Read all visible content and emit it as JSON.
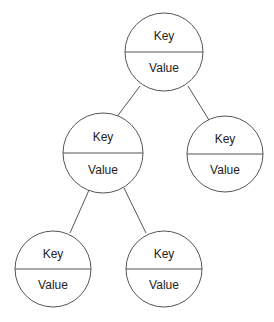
{
  "diagram": {
    "type": "binary-tree",
    "colors": {
      "stroke": "#555555",
      "text": "#222222",
      "background": "#ffffff"
    },
    "nodes": [
      {
        "id": "root",
        "key": "Key",
        "value": "Value",
        "cx": 164,
        "cy": 52,
        "r": 39
      },
      {
        "id": "left",
        "key": "Key",
        "value": "Value",
        "cx": 103,
        "cy": 153,
        "r": 40
      },
      {
        "id": "right",
        "key": "Key",
        "value": "Value",
        "cx": 225,
        "cy": 154,
        "r": 38
      },
      {
        "id": "left-left",
        "key": "Key",
        "value": "Value",
        "cx": 53,
        "cy": 269,
        "r": 38
      },
      {
        "id": "left-right",
        "key": "Key",
        "value": "Value",
        "cx": 164,
        "cy": 269,
        "r": 38
      }
    ],
    "edges": [
      {
        "from": "root",
        "to": "left",
        "x1": 140,
        "y1": 86,
        "x2": 116,
        "y2": 118
      },
      {
        "from": "root",
        "to": "right",
        "x1": 188,
        "y1": 86,
        "x2": 209,
        "y2": 120
      },
      {
        "from": "left",
        "to": "left-left",
        "x1": 89,
        "y1": 190,
        "x2": 70,
        "y2": 233
      },
      {
        "from": "left",
        "to": "left-right",
        "x1": 124,
        "y1": 188,
        "x2": 146,
        "y2": 233
      }
    ]
  }
}
